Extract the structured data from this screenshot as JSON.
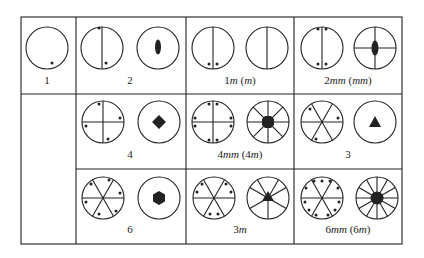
{
  "figure": {
    "cells": [
      {
        "id": "1",
        "label": "1"
      },
      {
        "id": "2",
        "label": "2"
      },
      {
        "id": "1m",
        "label": "1m (m)",
        "label_main": "1",
        "label_italic": "m",
        "label_paren": "m"
      },
      {
        "id": "2mm",
        "label": "2mm (mm)",
        "label_main": "2",
        "label_italic": "mm",
        "label_paren": "mm"
      },
      {
        "id": "4",
        "label": "4"
      },
      {
        "id": "4mm",
        "label": "4mm (4m)",
        "label_main": "4",
        "label_italic": "mm",
        "label_paren_num": "4",
        "label_paren": "m"
      },
      {
        "id": "3",
        "label": "3"
      },
      {
        "id": "6",
        "label": "6"
      },
      {
        "id": "3m",
        "label": "3m",
        "label_main": "3",
        "label_italic": "m"
      },
      {
        "id": "6mm",
        "label": "6mm (6m)",
        "label_main": "6",
        "label_italic": "mm",
        "label_paren_num": "6",
        "label_paren": "m"
      }
    ],
    "symbols": {
      "2": "filled-ellipse (diad)",
      "4": "filled-square (tetrad)",
      "3": "filled-triangle (triad)",
      "6": "filled-hexagon (hexad)"
    },
    "colors": {
      "line": "#222222",
      "background": "#ffffff"
    }
  }
}
